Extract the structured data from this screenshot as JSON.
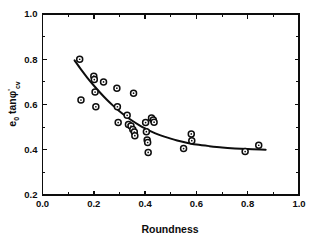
{
  "chart_data": {
    "type": "scatter",
    "title": "",
    "xlabel": "Roundness",
    "ylabel": "e0 tanφ'cv",
    "ylabel_parts": {
      "base1": "e",
      "sub1": "0",
      "base2": " tanφ",
      "prime": "'",
      "sub2": "cv"
    },
    "xlim": [
      0.0,
      1.0
    ],
    "ylim": [
      0.2,
      1.0
    ],
    "xticks": [
      0.0,
      0.2,
      0.4,
      0.6,
      0.8,
      1.0
    ],
    "yticks": [
      0.2,
      0.4,
      0.6,
      0.8,
      1.0
    ],
    "xtick_labels": [
      "0.0",
      "0.2",
      "0.4",
      "0.6",
      "0.8",
      "1.0"
    ],
    "ytick_labels": [
      "0.2",
      "0.4",
      "0.6",
      "0.8",
      "1.0"
    ],
    "xminor_step": 0.1,
    "yminor_step": 0.1,
    "grid": false,
    "legend": null,
    "marker": "open-circle",
    "marker_size_px": 3.0,
    "series": [
      {
        "name": "e0 tan phi'cv vs Roundness",
        "points": [
          [
            0.145,
            0.8
          ],
          [
            0.15,
            0.62
          ],
          [
            0.2,
            0.725
          ],
          [
            0.202,
            0.71
          ],
          [
            0.205,
            0.655
          ],
          [
            0.208,
            0.59
          ],
          [
            0.238,
            0.7
          ],
          [
            0.29,
            0.672
          ],
          [
            0.292,
            0.59
          ],
          [
            0.295,
            0.52
          ],
          [
            0.33,
            0.552
          ],
          [
            0.335,
            0.512
          ],
          [
            0.345,
            0.505
          ],
          [
            0.352,
            0.49
          ],
          [
            0.355,
            0.65
          ],
          [
            0.358,
            0.478
          ],
          [
            0.36,
            0.462
          ],
          [
            0.402,
            0.52
          ],
          [
            0.405,
            0.48
          ],
          [
            0.408,
            0.443
          ],
          [
            0.41,
            0.432
          ],
          [
            0.412,
            0.388
          ],
          [
            0.425,
            0.54
          ],
          [
            0.432,
            0.532
          ],
          [
            0.435,
            0.522
          ],
          [
            0.55,
            0.405
          ],
          [
            0.58,
            0.47
          ],
          [
            0.582,
            0.44
          ],
          [
            0.79,
            0.392
          ],
          [
            0.843,
            0.42
          ]
        ]
      }
    ],
    "fit_curve": {
      "name": "fitted-trend",
      "points": [
        [
          0.125,
          0.795
        ],
        [
          0.15,
          0.755
        ],
        [
          0.175,
          0.718
        ],
        [
          0.2,
          0.684
        ],
        [
          0.225,
          0.652
        ],
        [
          0.25,
          0.622
        ],
        [
          0.275,
          0.595
        ],
        [
          0.3,
          0.57
        ],
        [
          0.325,
          0.548
        ],
        [
          0.35,
          0.528
        ],
        [
          0.375,
          0.51
        ],
        [
          0.4,
          0.494
        ],
        [
          0.425,
          0.48
        ],
        [
          0.45,
          0.468
        ],
        [
          0.475,
          0.458
        ],
        [
          0.5,
          0.449
        ],
        [
          0.525,
          0.441
        ],
        [
          0.55,
          0.434
        ],
        [
          0.575,
          0.428
        ],
        [
          0.6,
          0.423
        ],
        [
          0.65,
          0.416
        ],
        [
          0.7,
          0.41
        ],
        [
          0.75,
          0.406
        ],
        [
          0.8,
          0.403
        ],
        [
          0.85,
          0.401
        ],
        [
          0.87,
          0.4
        ]
      ]
    }
  }
}
